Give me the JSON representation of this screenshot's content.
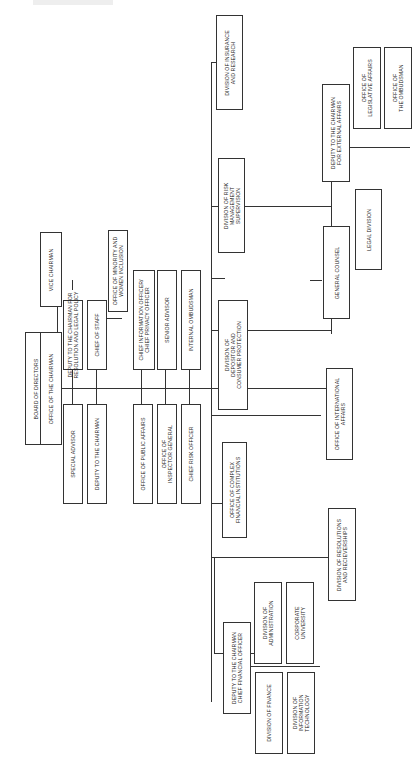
{
  "chart": {
    "orientation": "rotated-90-ccw",
    "root": {
      "label": "BOARD OF DIRECTORS"
    },
    "chairman": {
      "label": "OFFICE OF THE CHAIRMAN"
    },
    "vice_chairman": {
      "label": "VICE CHAIRMAN"
    },
    "staff_upper": [
      {
        "label": "DEPUTY TO THE CHAIRMAN FOR\nRESOLUTION AND LEGAL POLICY"
      },
      {
        "label": "CHIEF OF STAFF"
      },
      {
        "label": "OFFICE OF MINORITY AND\nWOMEN INCLUSION"
      },
      {
        "label": "CHIEF INFORMATION OFFICER/\nCHIEF PRIVACY OFFICER"
      },
      {
        "label": "SENIOR ADVISOR"
      },
      {
        "label": "INTERNAL OMBUDSMAN"
      }
    ],
    "staff_lower": [
      {
        "label": "SPECIAL ADVISOR"
      },
      {
        "label": "DEPUTY TO THE CHAIRMAN"
      },
      {
        "label": "OFFICE OF PUBLIC AFFAIRS"
      },
      {
        "label": "OFFICE OF\nINSPECTOR GENERAL"
      },
      {
        "label": "CHIEF RISK OFFICER"
      }
    ],
    "divisions": {
      "complex_financial": "OFFICE OF COMPLEX\nFINANCIAL INSTITUTIONS",
      "depositor_consumer": "DIVISION OF\nDEPOSITOR AND\nCONSUMER PROTECTION",
      "risk_management": "DIVISION OF RISK\nMANAGEMENT\nSUPERVISION",
      "international": "OFFICE OF INTERNATIONAL\nAFFAIRS",
      "insurance_research": "DIVISION OF INSURANCE\nAND RESEARCH",
      "general_counsel": "GENERAL COUNSEL",
      "legal_division": "LEGAL DIVISION",
      "external_affairs": "DEPUTY TO THE CHAIRMAN\nFOR EXTERNAL AFFAIRS",
      "legislative_affairs": "OFFICE OF\nLEGISLATIVE AFFAIRS",
      "ombudsman": "OFFICE OF\nTHE OMBUDSMAN",
      "cfo": "DEPUTY TO THE CHAIRMAN\nCHIEF FINANCIAL OFFICER",
      "administration": "DIVISION OF\nADMINISTRATION",
      "corporate_university": "CORPORATE\nUNIVERSITY",
      "finance": "DIVISION OF FINANCE",
      "information_technology": "DIVISION OF\nINFORMATION\nTECHNOLOGY",
      "resolutions_receiverships": "DIVISION OF RESOLUTIONS\nAND RECIEVERSHIPS"
    }
  }
}
